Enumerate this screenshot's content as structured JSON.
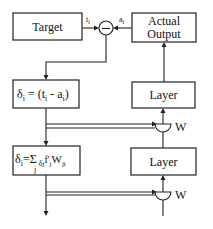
{
  "diagram": {
    "type": "backpropagation block diagram",
    "colors": {
      "stroke": "#222222",
      "text": "#111111",
      "background": "#ffffff"
    },
    "blocks": {
      "target": {
        "label": "Target"
      },
      "actual_output": {
        "line1": "Actual",
        "line2": "Output"
      },
      "delta_output": {
        "delta": "δ",
        "sub_i": "i",
        "eq": " = (t",
        "sub_i2": "i",
        "minus": " - a",
        "sub_i3": "i",
        "close": ")"
      },
      "delta_hidden": {
        "delta": "δ",
        "sub_i": "i",
        "eq": "=",
        "sigma": "Σ",
        "sub_j": "j",
        "delta2": " δ",
        "sub_j2": "j",
        "fprime": "f'",
        "sub_j3": "j",
        "w": "W",
        "sub_ji": "ji"
      },
      "layer_top": {
        "label": "Layer"
      },
      "layer_bottom": {
        "label": "Layer"
      }
    },
    "comparator": {
      "symbol": "−",
      "input_target_label": "t",
      "input_target_sub": "i",
      "input_actual_label": "a",
      "input_actual_sub": "i"
    },
    "weight_updates": [
      {
        "label": "W"
      },
      {
        "label": "W"
      }
    ]
  }
}
